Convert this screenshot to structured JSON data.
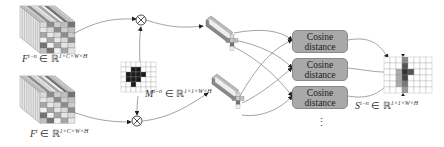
{
  "diagram": {
    "inputs": [
      {
        "id": "feature-prev",
        "symbol": "F",
        "superscript": "t−n",
        "set": "ℝ",
        "dims": "1×C×W×H"
      },
      {
        "id": "feature-curr",
        "symbol": "F",
        "superscript": "t",
        "set": "ℝ",
        "dims": "1×C×W×H"
      }
    ],
    "mask": {
      "symbol": "M",
      "superscript": "t−n",
      "set": "ℝ",
      "dims": "1×1×W×H"
    },
    "operator": {
      "name": "element-wise multiplication",
      "glyph": "⊗"
    },
    "cosine_boxes": [
      {
        "line1": "Cosine",
        "line2": "distance"
      },
      {
        "line1": "Cosine",
        "line2": "distance"
      },
      {
        "line1": "Cosine",
        "line2": "distance"
      }
    ],
    "ellipsis": "⋮",
    "output": {
      "symbol": "S",
      "superscript": "t−n",
      "set": "ℝ",
      "dims": "1×1×W×H"
    },
    "colors": {
      "box_fill": "#a9a9a9",
      "mask_fill": "#1a1a1a",
      "line": "#8c8c8c"
    }
  }
}
